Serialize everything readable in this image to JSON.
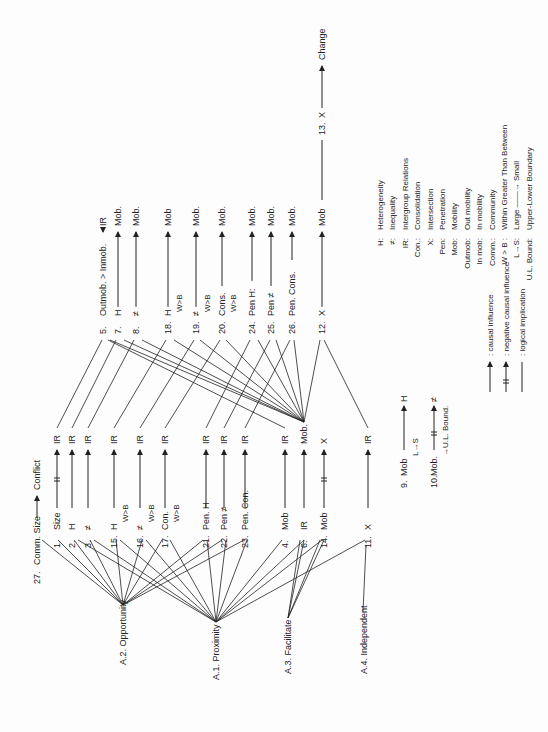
{
  "title_row": {
    "num": "27.",
    "from": "Comm. Size",
    "to": "Conflict"
  },
  "assumptions": [
    {
      "id": "a2",
      "label": "A.2.  Opportunity"
    },
    {
      "id": "a1",
      "label": "A.1.  Proximity"
    },
    {
      "id": "a3",
      "label": "A.3.  Facilitate"
    },
    {
      "id": "a4",
      "label": "A.4.  Independent"
    }
  ],
  "lower_props": [
    {
      "num": "1.",
      "from": "Size",
      "to": "IR",
      "neg": true,
      "sub": ""
    },
    {
      "num": "2.",
      "from": "H",
      "to": "IR",
      "neg": false,
      "sub": ""
    },
    {
      "num": "3.",
      "from": "≠",
      "to": "IR",
      "neg": false,
      "sub": ""
    },
    {
      "num": "15.",
      "from": "H",
      "to": "IR",
      "neg": false,
      "sub": "W>B"
    },
    {
      "num": "16.",
      "from": "≠",
      "to": "IR",
      "neg": false,
      "sub": "W>B"
    },
    {
      "num": "17.",
      "from": "Con.",
      "to": "IR",
      "neg": false,
      "sub": "W>B"
    },
    {
      "num": "21.",
      "from": "Pen. H",
      "to": "IR",
      "neg": false,
      "sub": ""
    },
    {
      "num": "22.",
      "from": "Pen ≠",
      "to": "IR",
      "neg": false,
      "sub": ""
    },
    {
      "num": "23.",
      "from": "Pen. Con.",
      "to": "IR",
      "neg": false,
      "sub": ""
    },
    {
      "num": "4.",
      "from": "Mob",
      "to": "IR",
      "neg": false,
      "sub": ""
    },
    {
      "num": "6.",
      "from": "IR",
      "to": "Mob.",
      "neg": false,
      "sub": ""
    },
    {
      "num": "14.",
      "from": "Mob",
      "to": "X",
      "neg": true,
      "sub": ""
    },
    {
      "num": "11.",
      "from": "X",
      "to": "IR",
      "neg": false,
      "sub": ""
    }
  ],
  "upper_props": [
    {
      "num": "5.",
      "from": "Outmob. > Inmob.",
      "to": "IR",
      "sub": ""
    },
    {
      "num": "7.",
      "from": "H",
      "to": "Mob.",
      "sub": ""
    },
    {
      "num": "8.",
      "from": "≠",
      "to": "Mob.",
      "sub": ""
    },
    {
      "num": "18.",
      "from": "H",
      "to": "Mob",
      "sub": "W>B"
    },
    {
      "num": "19.",
      "from": "≠",
      "to": "Mob.",
      "sub": "W>B"
    },
    {
      "num": "20.",
      "from": "Cons.",
      "to": "Mob.",
      "sub": "W>B"
    },
    {
      "num": "24.",
      "from": "Pen H:",
      "to": "Mob.",
      "sub": ""
    },
    {
      "num": "25.",
      "from": "Pen ≠",
      "to": "Mob.",
      "sub": ""
    },
    {
      "num": "26.",
      "from": "Pen. Cons.",
      "to": "Mob.",
      "sub": ""
    },
    {
      "num": "12.",
      "from": "X",
      "to": "Mob",
      "sub": ""
    }
  ],
  "top_prop": {
    "num": "13.",
    "from": "X",
    "to": "Change"
  },
  "side_props": [
    {
      "num": "9.",
      "from": "Mob",
      "to": "H",
      "sub": "L→S",
      "neg": false
    },
    {
      "num": "10.",
      "from": "Mob.",
      "to": "≠",
      "sub": "→U.L. Bound.",
      "neg": true
    }
  ],
  "key_arrows": [
    {
      "symbol": "causal",
      "label": ": causal influence"
    },
    {
      "symbol": "negative",
      "label": ": negative causal influence"
    },
    {
      "symbol": "logical",
      "label": ": logical implication"
    }
  ],
  "abbreviations": [
    {
      "abbr": "H:",
      "meaning": "Heterogeneity"
    },
    {
      "abbr": "≠:",
      "meaning": "Inequality"
    },
    {
      "abbr": "IR:",
      "meaning": "Intergroup Relations"
    },
    {
      "abbr": "Con.:",
      "meaning": "Consolidation"
    },
    {
      "abbr": "X:",
      "meaning": "Intersection"
    },
    {
      "abbr": "Pen:",
      "meaning": "Penetration"
    },
    {
      "abbr": "Mob:",
      "meaning": "Mobility"
    },
    {
      "abbr": "Outmob:",
      "meaning": "Out mobility"
    },
    {
      "abbr": "In mob:",
      "meaning": "In mobility"
    },
    {
      "abbr": "Comm.:",
      "meaning": "Community"
    },
    {
      "abbr": "W > B :",
      "meaning": "Within Greater Than Between"
    },
    {
      "abbr": "L→S:",
      "meaning": "Large ——→ Small"
    },
    {
      "abbr": "U.L. Bound:",
      "meaning": "Upper-Lower Boundary"
    }
  ]
}
